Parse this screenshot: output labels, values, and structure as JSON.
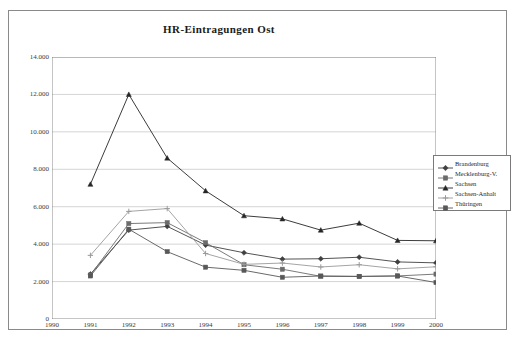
{
  "chart_data": {
    "type": "line",
    "title": "HR-Eintragungen Ost",
    "xlabel": "",
    "ylabel": "",
    "x": [
      1990,
      1991,
      1992,
      1993,
      1994,
      1995,
      1996,
      1997,
      1998,
      1999,
      2000
    ],
    "xtick_labels": [
      "1990",
      "1991",
      "1992",
      "1993",
      "1994",
      "1995",
      "1996",
      "1997",
      "1998",
      "1999",
      "2000"
    ],
    "ytick_labels": [
      "0",
      "2.000",
      "4.000",
      "6.000",
      "8.000",
      "10.000",
      "12.000",
      "14.000"
    ],
    "ytick_values": [
      0,
      2000,
      4000,
      6000,
      8000,
      10000,
      12000,
      14000
    ],
    "ylim": [
      0,
      14000
    ],
    "xlim": [
      1990,
      2000
    ],
    "grid": "horizontal",
    "legend_position": "right",
    "series": [
      {
        "name": "Brandenburg",
        "marker": "diamond",
        "color": "#404040",
        "x": [
          1991,
          1992,
          1993,
          1994,
          1995,
          1996,
          1997,
          1998,
          1999,
          2000
        ],
        "values": [
          2400,
          4750,
          4950,
          3950,
          3540,
          3200,
          3220,
          3300,
          3050,
          3000
        ]
      },
      {
        "name": "Mecklenburg-V.",
        "marker": "square",
        "color": "#6b6b6b",
        "x": [
          1991,
          1992,
          1993,
          1994,
          1995,
          1996,
          1997,
          1998,
          1999,
          2000
        ],
        "values": [
          2350,
          5100,
          5150,
          4080,
          2900,
          2660,
          2280,
          2270,
          2300,
          2400
        ]
      },
      {
        "name": "Sachsen",
        "marker": "triangle",
        "color": "#262626",
        "x": [
          1991,
          1992,
          1993,
          1994,
          1995,
          1996,
          1997,
          1998,
          1999,
          2000
        ],
        "values": [
          7200,
          12000,
          8600,
          6850,
          5520,
          5350,
          4750,
          5120,
          4200,
          4180
        ]
      },
      {
        "name": "Sachsen-Anhalt",
        "marker": "plus",
        "color": "#9a9a9a",
        "x": [
          1991,
          1992,
          1993,
          1994,
          1995,
          1996,
          1997,
          1998,
          1999,
          2000
        ],
        "values": [
          3400,
          5750,
          5900,
          3500,
          2920,
          2990,
          2780,
          2900,
          2680,
          2790
        ]
      },
      {
        "name": "Thüringen",
        "marker": "square",
        "color": "#585858",
        "x": [
          1991,
          1992,
          1993,
          1994,
          1995,
          1996,
          1997,
          1998,
          1999,
          2000
        ],
        "values": [
          2300,
          4800,
          3600,
          2770,
          2600,
          2230,
          2300,
          2280,
          2300,
          1950
        ]
      }
    ]
  }
}
